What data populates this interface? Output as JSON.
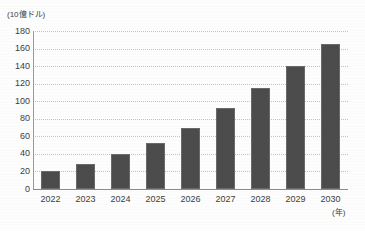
{
  "chart_data": {
    "type": "bar",
    "title": "",
    "subtitle": "",
    "xlabel": "(年)",
    "ylabel": "(10億ドル)",
    "categories": [
      "2022",
      "2023",
      "2024",
      "2025",
      "2026",
      "2027",
      "2028",
      "2029",
      "2030"
    ],
    "values": [
      20,
      28,
      40,
      52,
      70,
      92,
      115,
      140,
      165
    ],
    "series": [
      {
        "name": "",
        "values": [
          20,
          28,
          40,
          52,
          70,
          92,
          115,
          140,
          165
        ]
      }
    ],
    "ylim": [
      0,
      180
    ],
    "ytick_labels": [
      "180",
      "160",
      "140",
      "120",
      "100",
      "80",
      "60",
      "40",
      "20",
      "0"
    ],
    "ytick_values": [
      180,
      160,
      140,
      120,
      100,
      80,
      60,
      40,
      20,
      0
    ],
    "y_unit_caption": "(10億ドル)",
    "x_unit_caption": "(年)",
    "grid": "horizontal-dotted",
    "legend": "none",
    "legend_position": "none",
    "annotations": [],
    "colors": {
      "bar_fill": "#4c4c4c",
      "bar_edge": "#6a6a6a",
      "gridline": "#c3c3c3",
      "axis": "#8c8c8c",
      "text": "#3d3d3d",
      "background": "#fefefe"
    }
  }
}
